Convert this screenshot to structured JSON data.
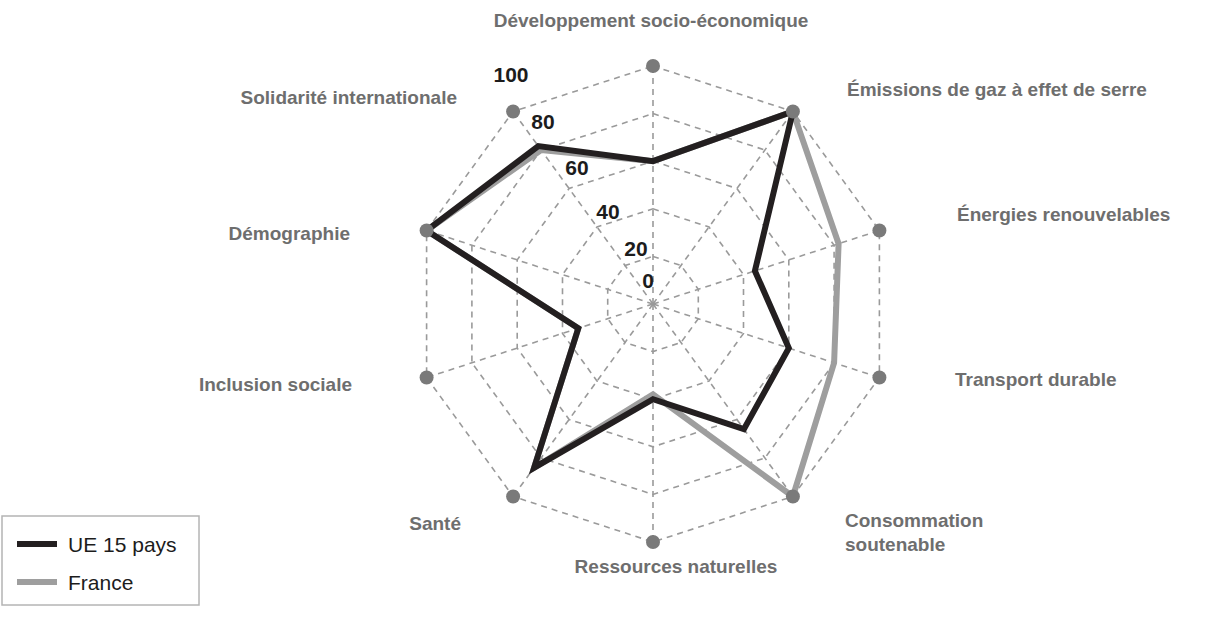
{
  "chart_data": {
    "type": "radar",
    "title": "",
    "categories": [
      "Développement socio-économique",
      "Émissions de gaz à effet de serre",
      "Énergies renouvelables",
      "Transport durable",
      "Consommation soutenable",
      "Ressources naturelles",
      "Santé",
      "Inclusion sociale",
      "Démographie",
      "Solidarité internationale"
    ],
    "series": [
      {
        "name": "UE 15 pays",
        "color": "#231f20",
        "values": [
          60,
          100,
          45,
          60,
          65,
          40,
          85,
          33,
          100,
          82
        ]
      },
      {
        "name": "France",
        "color": "#9e9e9e",
        "values": [
          60,
          100,
          82,
          80,
          100,
          38,
          85,
          33,
          100,
          80
        ]
      }
    ],
    "ticks": [
      0,
      20,
      40,
      60,
      80,
      100
    ],
    "tick_labels": [
      "0",
      "20",
      "40",
      "60",
      "80",
      "100"
    ],
    "rlim": [
      0,
      100
    ],
    "grid": true,
    "legend_position": "bottom-left"
  },
  "legend": {
    "items": [
      {
        "label": "UE 15 pays",
        "color": "#231f20"
      },
      {
        "label": "France",
        "color": "#9e9e9e"
      }
    ]
  },
  "labels": {
    "axis_0": "Développement socio-économique",
    "axis_1": "Émissions de gaz à effet de serre",
    "axis_2": "Énergies renouvelables",
    "axis_3": "Transport durable",
    "axis_4_line1": "Consommation",
    "axis_4_line2": "soutenable",
    "axis_5": "Ressources naturelles",
    "axis_6": "Santé",
    "axis_7": "Inclusion sociale",
    "axis_8": "Démographie",
    "axis_9": "Solidarité internationale"
  },
  "ticks": {
    "t0": "0",
    "t20": "20",
    "t40": "40",
    "t60": "60",
    "t80": "80",
    "t100": "100"
  },
  "colors": {
    "series_ue": "#231f20",
    "series_france": "#9e9e9e",
    "grid": "#9a9a9a",
    "label": "#6e6e6e",
    "background": "#ffffff"
  }
}
